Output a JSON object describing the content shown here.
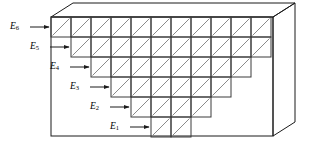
{
  "figure": {
    "colors": {
      "outline": "#1a1a1a",
      "cell_stroke": "#3a3a3a",
      "diagonal": "#8a8a8a",
      "background": "#ffffff"
    },
    "box": {
      "front_face": {
        "x": 51,
        "y": 17,
        "width": 222,
        "height": 119
      },
      "depth_dx": 22,
      "depth_dy": -14
    },
    "grid": {
      "cell_size": 20,
      "origin_x": 51,
      "origin_y": 17,
      "diagonal_direction": "bottom-left-to-top-right",
      "rows": [
        {
          "label": "E_6",
          "index": 6,
          "row_top_y": 17,
          "start_x": 51,
          "cells": 11
        },
        {
          "label": "E_5",
          "index": 5,
          "row_top_y": 37,
          "start_x": 71,
          "cells": 10
        },
        {
          "label": "E_4",
          "index": 4,
          "row_top_y": 57,
          "start_x": 91,
          "cells": 8
        },
        {
          "label": "E_3",
          "index": 3,
          "row_top_y": 77,
          "start_x": 111,
          "cells": 6
        },
        {
          "label": "E_2",
          "index": 2,
          "row_top_y": 97,
          "start_x": 131,
          "cells": 4
        },
        {
          "label": "E_1",
          "index": 1,
          "row_top_y": 117,
          "start_x": 151,
          "cells": 2
        }
      ]
    },
    "labels": [
      {
        "name": "E",
        "sub": "6",
        "text_x": 10,
        "text_y": 22,
        "arrow_x1": 30,
        "arrow_x2": 49,
        "arrow_y": 27
      },
      {
        "name": "E",
        "sub": "5",
        "text_x": 30,
        "text_y": 42,
        "arrow_x1": 50,
        "arrow_x2": 69,
        "arrow_y": 47
      },
      {
        "name": "E",
        "sub": "4",
        "text_x": 50,
        "text_y": 62,
        "arrow_x1": 70,
        "arrow_x2": 89,
        "arrow_y": 67
      },
      {
        "name": "E",
        "sub": "3",
        "text_x": 70,
        "text_y": 82,
        "arrow_x1": 90,
        "arrow_x2": 109,
        "arrow_y": 87
      },
      {
        "name": "E",
        "sub": "2",
        "text_x": 90,
        "text_y": 102,
        "arrow_x1": 110,
        "arrow_x2": 129,
        "arrow_y": 107
      },
      {
        "name": "E",
        "sub": "1",
        "text_x": 110,
        "text_y": 122,
        "arrow_x1": 130,
        "arrow_x2": 149,
        "arrow_y": 127
      }
    ]
  }
}
